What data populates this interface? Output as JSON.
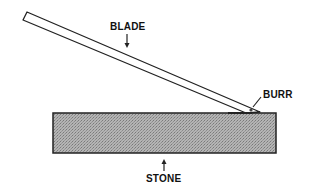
{
  "diagram": {
    "labels": {
      "blade": "BLADE",
      "burr": "BURR",
      "stone": "STONE"
    },
    "colors": {
      "stone_fill": "#a8a8a8",
      "outline": "#222222",
      "background": "#ffffff"
    }
  }
}
